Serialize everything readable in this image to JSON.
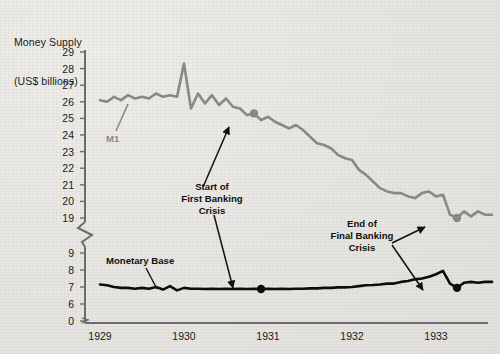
{
  "chart_data": {
    "type": "line",
    "title": "Money Supply",
    "subtitle": "(US$ billions)",
    "ylabel": "Money Supply (US$ billions)",
    "xlabel": "",
    "grid": false,
    "legend_position": "inline-labels",
    "axis_break": {
      "present": true,
      "between": [
        9,
        19
      ],
      "second_break_between": [
        0,
        6
      ]
    },
    "xlim": [
      1929.0,
      1933.75
    ],
    "x_tick_labels": [
      "1929",
      "1930",
      "1931",
      "1932",
      "1933"
    ],
    "x_ticks": [
      1929,
      1930,
      1931,
      1932,
      1933
    ],
    "y_tick_labels": [
      "29",
      "28",
      "27",
      "26",
      "25",
      "24",
      "23",
      "22",
      "21",
      "20",
      "19",
      "9",
      "8",
      "7",
      "6",
      "0"
    ],
    "y_ticks_upper": [
      19,
      20,
      21,
      22,
      23,
      24,
      25,
      26,
      27,
      28,
      29
    ],
    "y_ticks_lower": [
      0,
      6,
      7,
      8,
      9
    ],
    "series": [
      {
        "name": "M1",
        "color": "#8a8a8a",
        "label": "M1",
        "x": [
          1929.0,
          1929.083,
          1929.167,
          1929.25,
          1929.333,
          1929.417,
          1929.5,
          1929.583,
          1929.667,
          1929.75,
          1929.833,
          1929.917,
          1930.0,
          1930.083,
          1930.167,
          1930.25,
          1930.333,
          1930.417,
          1930.5,
          1930.583,
          1930.667,
          1930.75,
          1930.833,
          1930.917,
          1931.0,
          1931.083,
          1931.167,
          1931.25,
          1931.333,
          1931.417,
          1931.5,
          1931.583,
          1931.667,
          1931.75,
          1931.833,
          1931.917,
          1932.0,
          1932.083,
          1932.167,
          1932.25,
          1932.333,
          1932.417,
          1932.5,
          1932.583,
          1932.667,
          1932.75,
          1932.833,
          1932.917,
          1933.0,
          1933.083,
          1933.167,
          1933.25,
          1933.333,
          1933.417,
          1933.5,
          1933.583,
          1933.667
        ],
        "values": [
          26.1,
          26.0,
          26.3,
          26.1,
          26.4,
          26.2,
          26.3,
          26.2,
          26.5,
          26.3,
          26.4,
          26.3,
          28.3,
          25.6,
          26.5,
          25.9,
          26.4,
          25.8,
          26.2,
          25.7,
          25.6,
          25.2,
          25.3,
          24.9,
          25.1,
          24.8,
          24.6,
          24.4,
          24.6,
          24.3,
          23.9,
          23.5,
          23.4,
          23.2,
          22.8,
          22.6,
          22.5,
          21.9,
          21.6,
          21.2,
          20.8,
          20.6,
          20.5,
          20.5,
          20.3,
          20.2,
          20.5,
          20.6,
          20.3,
          20.4,
          19.2,
          19.0,
          19.4,
          19.1,
          19.4,
          19.2,
          19.2
        ]
      },
      {
        "name": "Monetary Base",
        "color": "#0d0d0d",
        "label": "Monetary Base",
        "x": [
          1929.0,
          1929.083,
          1929.167,
          1929.25,
          1929.333,
          1929.417,
          1929.5,
          1929.583,
          1929.667,
          1929.75,
          1929.833,
          1929.917,
          1930.0,
          1930.083,
          1930.167,
          1930.25,
          1930.333,
          1930.417,
          1930.5,
          1930.583,
          1930.667,
          1930.75,
          1930.833,
          1930.917,
          1931.0,
          1931.083,
          1931.167,
          1931.25,
          1931.333,
          1931.417,
          1931.5,
          1931.583,
          1931.667,
          1931.75,
          1931.833,
          1931.917,
          1932.0,
          1932.083,
          1932.167,
          1932.25,
          1932.333,
          1932.417,
          1932.5,
          1932.583,
          1932.667,
          1932.75,
          1932.833,
          1932.917,
          1933.0,
          1933.083,
          1933.167,
          1933.25,
          1933.333,
          1933.417,
          1933.5,
          1933.583,
          1933.667
        ],
        "values": [
          7.15,
          7.1,
          7.0,
          6.95,
          6.95,
          6.9,
          6.95,
          6.9,
          7.0,
          6.85,
          7.05,
          6.8,
          6.95,
          6.9,
          6.9,
          6.88,
          6.9,
          6.88,
          6.9,
          6.88,
          6.9,
          6.88,
          6.9,
          6.88,
          6.9,
          6.88,
          6.9,
          6.88,
          6.9,
          6.9,
          6.92,
          6.92,
          6.95,
          6.95,
          6.98,
          6.98,
          7.0,
          7.05,
          7.1,
          7.12,
          7.15,
          7.2,
          7.2,
          7.3,
          7.35,
          7.45,
          7.5,
          7.6,
          7.75,
          7.95,
          7.2,
          6.95,
          7.25,
          7.3,
          7.25,
          7.3,
          7.3
        ]
      }
    ],
    "markers": [
      {
        "series": "M1",
        "x": 1930.833,
        "y": 25.3,
        "color": "#8a8a8a",
        "annotation": "start-first-banking-crisis"
      },
      {
        "series": "Monetary Base",
        "x": 1930.917,
        "y": 6.88,
        "color": "#0d0d0d",
        "annotation": "start-first-banking-crisis"
      },
      {
        "series": "M1",
        "x": 1933.25,
        "y": 19.0,
        "color": "#8a8a8a",
        "annotation": "end-final-banking-crisis"
      },
      {
        "series": "Monetary Base",
        "x": 1933.25,
        "y": 6.95,
        "color": "#0d0d0d",
        "annotation": "end-final-banking-crisis"
      }
    ],
    "annotations": [
      {
        "id": "start-first-banking-crisis",
        "lines": [
          "Start of",
          "First Banking",
          "Crisis"
        ]
      },
      {
        "id": "end-final-banking-crisis",
        "lines": [
          "End of",
          "Final Banking",
          "Crisis"
        ]
      }
    ]
  },
  "labels": {
    "m1": "M1",
    "monetary_base": "Monetary Base",
    "anno1_line1": "Start of",
    "anno1_line2": "First Banking",
    "anno1_line3": "Crisis",
    "anno2_line1": "End of",
    "anno2_line2": "Final Banking",
    "anno2_line3": "Crisis"
  },
  "axis": {
    "title_line1": "Money Supply",
    "title_line2": "(US$ billions)",
    "y0": "0",
    "y6": "6",
    "y7": "7",
    "y8": "8",
    "y9": "9",
    "y19": "19",
    "y20": "20",
    "y21": "21",
    "y22": "22",
    "y23": "23",
    "y24": "24",
    "y25": "25",
    "y26": "26",
    "y27": "27",
    "y28": "28",
    "y29": "29",
    "x1929": "1929",
    "x1930": "1930",
    "x1931": "1931",
    "x1932": "1932",
    "x1933": "1933"
  },
  "colors": {
    "m1_line": "#8a8a8a",
    "base_line": "#0d0d0d",
    "axis": "#6e6e6e",
    "text": "#1b1b1b",
    "background": "#e8e7e3"
  }
}
